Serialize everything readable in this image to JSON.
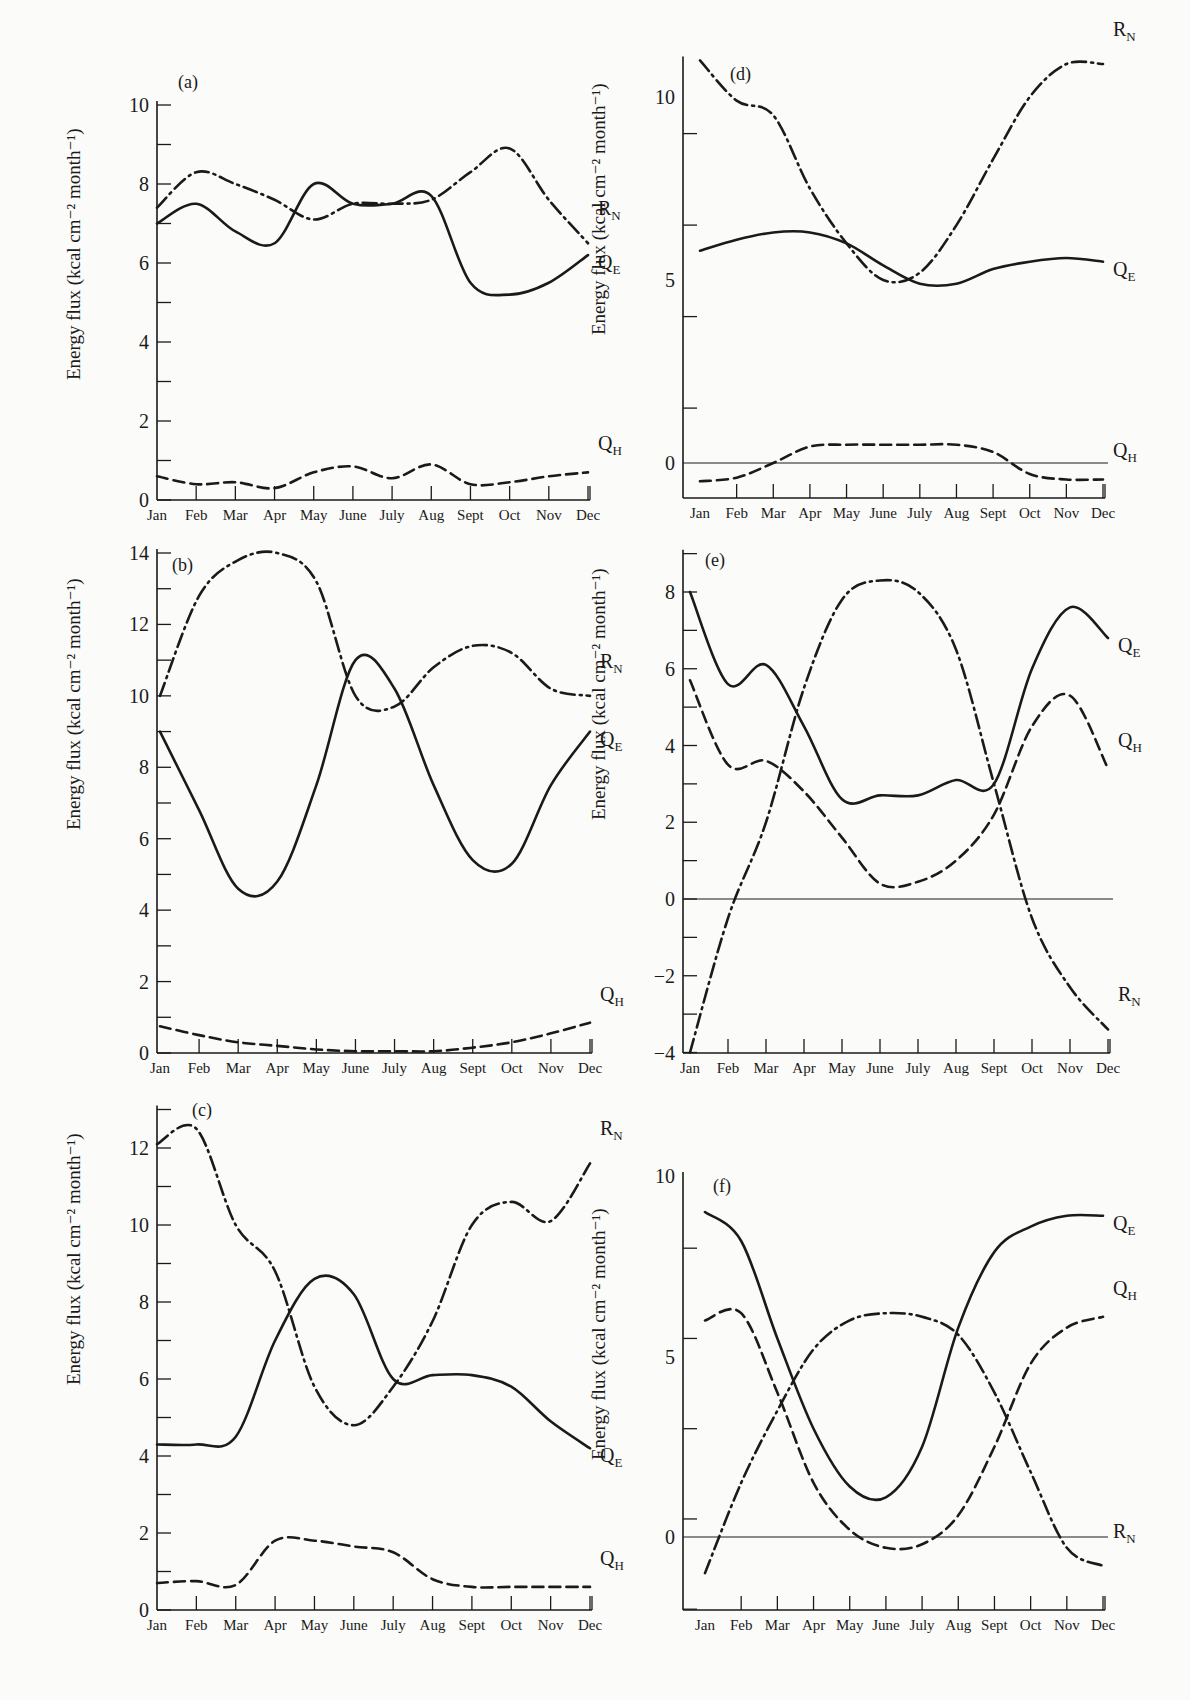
{
  "figure": {
    "ylabel": "Energy flux (kcal cm⁻² month⁻¹)",
    "months": [
      "Jan",
      "Feb",
      "Mar",
      "Apr",
      "May",
      "June",
      "July",
      "Aug",
      "Sept",
      "Oct",
      "Nov",
      "Dec"
    ],
    "series_labels": {
      "RN": "R",
      "RN_sub": "N",
      "QE": "Q",
      "QE_sub": "E",
      "QH": "Q",
      "QH_sub": "H"
    },
    "line_styles": {
      "RN": "dash-dot",
      "QE": "solid",
      "QH": "dashed"
    },
    "colors": {
      "ink": "#1a1a1a",
      "paper": "#fbfbf9"
    }
  },
  "chart_data": [
    {
      "panel": "(a)",
      "type": "line",
      "title": "",
      "xlabel": "",
      "ylabel": "Energy flux (kcal cm-2 month-1)",
      "categories": [
        "Jan",
        "Feb",
        "Mar",
        "Apr",
        "May",
        "June",
        "July",
        "Aug",
        "Sept",
        "Oct",
        "Nov",
        "Dec"
      ],
      "ylim": [
        0,
        10
      ],
      "yticks": [
        0,
        2,
        4,
        6,
        8,
        10
      ],
      "zero_line": false,
      "series": [
        {
          "name": "RN",
          "style": "dash-dot",
          "values": [
            7.4,
            8.3,
            8.0,
            7.6,
            7.1,
            7.5,
            7.5,
            7.6,
            8.3,
            8.9,
            7.6,
            6.5
          ]
        },
        {
          "name": "QE",
          "style": "solid",
          "values": [
            7.0,
            7.5,
            6.8,
            6.5,
            8.0,
            7.5,
            7.5,
            7.7,
            5.5,
            5.2,
            5.5,
            6.2
          ]
        },
        {
          "name": "QH",
          "style": "dashed",
          "values": [
            0.6,
            0.4,
            0.45,
            0.3,
            0.7,
            0.85,
            0.55,
            0.9,
            0.4,
            0.45,
            0.6,
            0.7
          ]
        }
      ]
    },
    {
      "panel": "(b)",
      "type": "line",
      "title": "",
      "xlabel": "",
      "ylabel": "Energy flux (kcal cm-2 month-1)",
      "categories": [
        "Jan",
        "Feb",
        "Mar",
        "Apr",
        "May",
        "June",
        "July",
        "Aug",
        "Sept",
        "Oct",
        "Nov",
        "Dec"
      ],
      "ylim": [
        0,
        14
      ],
      "yticks": [
        0,
        2,
        4,
        6,
        8,
        10,
        12,
        14
      ],
      "zero_line": false,
      "series": [
        {
          "name": "RN",
          "style": "dash-dot",
          "values": [
            10.0,
            12.8,
            13.8,
            14.0,
            13.2,
            10.0,
            9.7,
            10.8,
            11.4,
            11.2,
            10.2,
            10.0
          ]
        },
        {
          "name": "QE",
          "style": "solid",
          "values": [
            9.0,
            6.8,
            4.6,
            4.8,
            7.5,
            11.0,
            10.2,
            7.5,
            5.4,
            5.3,
            7.5,
            9.0
          ]
        },
        {
          "name": "QH",
          "style": "dashed",
          "values": [
            0.75,
            0.5,
            0.3,
            0.2,
            0.1,
            0.05,
            0.05,
            0.05,
            0.15,
            0.3,
            0.55,
            0.85
          ]
        }
      ]
    },
    {
      "panel": "(c)",
      "type": "line",
      "title": "",
      "xlabel": "",
      "ylabel": "Energy flux (kcal cm-2 month-1)",
      "categories": [
        "Jan",
        "Feb",
        "Mar",
        "Apr",
        "May",
        "June",
        "July",
        "Aug",
        "Sept",
        "Oct",
        "Nov",
        "Dec"
      ],
      "ylim": [
        0,
        13
      ],
      "yticks": [
        0,
        2,
        4,
        6,
        8,
        10,
        12
      ],
      "zero_line": false,
      "series": [
        {
          "name": "RN",
          "style": "dash-dot",
          "values": [
            12.1,
            12.5,
            10.0,
            8.8,
            5.8,
            4.8,
            5.8,
            7.5,
            10.0,
            10.6,
            10.1,
            11.6
          ]
        },
        {
          "name": "QE",
          "style": "solid",
          "values": [
            4.3,
            4.3,
            4.5,
            7.0,
            8.6,
            8.2,
            6.0,
            6.1,
            6.1,
            5.8,
            4.9,
            4.2
          ]
        },
        {
          "name": "QH",
          "style": "dashed",
          "values": [
            0.7,
            0.75,
            0.65,
            1.8,
            1.8,
            1.65,
            1.5,
            0.8,
            0.6,
            0.6,
            0.6,
            0.6
          ]
        }
      ]
    },
    {
      "panel": "(d)",
      "type": "line",
      "title": "",
      "xlabel": "",
      "ylabel": "Energy flux (kcal cm-2 month-1)",
      "categories": [
        "Jan",
        "Feb",
        "Mar",
        "Apr",
        "May",
        "June",
        "July",
        "Aug",
        "Sept",
        "Oct",
        "Nov",
        "Dec"
      ],
      "ylim": [
        -1,
        11
      ],
      "yticks": [
        0,
        5,
        10
      ],
      "zero_line": true,
      "series": [
        {
          "name": "RN",
          "style": "dash-dot",
          "values": [
            11.0,
            9.9,
            9.5,
            7.5,
            6.0,
            5.0,
            5.2,
            6.5,
            8.3,
            10.0,
            10.9,
            10.9
          ]
        },
        {
          "name": "QE",
          "style": "solid",
          "values": [
            5.8,
            6.1,
            6.3,
            6.3,
            6.0,
            5.4,
            4.9,
            4.9,
            5.3,
            5.5,
            5.6,
            5.5
          ]
        },
        {
          "name": "QH",
          "style": "dashed",
          "values": [
            -0.5,
            -0.4,
            0.0,
            0.45,
            0.5,
            0.5,
            0.5,
            0.5,
            0.3,
            -0.3,
            -0.45,
            -0.45
          ]
        }
      ]
    },
    {
      "panel": "(e)",
      "type": "line",
      "title": "",
      "xlabel": "",
      "ylabel": "Energy flux (kcal cm-2 month-1)",
      "categories": [
        "Jan",
        "Feb",
        "Mar",
        "Apr",
        "May",
        "June",
        "July",
        "Aug",
        "Sept",
        "Oct",
        "Nov",
        "Dec"
      ],
      "ylim": [
        -4,
        9
      ],
      "yticks": [
        -4,
        -2,
        0,
        2,
        4,
        6,
        8
      ],
      "zero_line": true,
      "series": [
        {
          "name": "RN",
          "style": "dash-dot",
          "values": [
            -4.0,
            -0.5,
            2.0,
            5.5,
            7.8,
            8.3,
            8.0,
            6.5,
            3.0,
            -0.5,
            -2.3,
            -3.4
          ]
        },
        {
          "name": "QE",
          "style": "solid",
          "values": [
            8.0,
            5.6,
            6.1,
            4.5,
            2.6,
            2.7,
            2.7,
            3.1,
            3.0,
            6.0,
            7.6,
            6.8
          ]
        },
        {
          "name": "QH",
          "style": "dashed",
          "values": [
            5.7,
            3.5,
            3.6,
            2.8,
            1.6,
            0.4,
            0.45,
            1.0,
            2.2,
            4.5,
            5.3,
            3.4
          ]
        }
      ]
    },
    {
      "panel": "(f)",
      "type": "line",
      "title": "",
      "xlabel": "",
      "ylabel": "Energy flux (kcal cm-2 month-1)",
      "categories": [
        "Jan",
        "Feb",
        "Mar",
        "Apr",
        "May",
        "June",
        "July",
        "Aug",
        "Sept",
        "Oct",
        "Nov",
        "Dec"
      ],
      "ylim": [
        -2,
        10
      ],
      "yticks": [
        0,
        5,
        10
      ],
      "zero_line": true,
      "series": [
        {
          "name": "RN",
          "style": "dash-dot",
          "values": [
            -1.0,
            1.5,
            3.5,
            5.2,
            6.0,
            6.2,
            6.1,
            5.6,
            4.0,
            1.8,
            -0.3,
            -0.8
          ]
        },
        {
          "name": "QE",
          "style": "solid",
          "values": [
            9.0,
            8.2,
            5.5,
            3.0,
            1.4,
            1.1,
            2.5,
            5.8,
            7.9,
            8.6,
            8.9,
            8.9
          ]
        },
        {
          "name": "QH",
          "style": "dashed",
          "values": [
            6.0,
            6.2,
            4.0,
            1.5,
            0.2,
            -0.3,
            -0.2,
            0.6,
            2.5,
            4.8,
            5.8,
            6.1
          ]
        }
      ]
    }
  ]
}
